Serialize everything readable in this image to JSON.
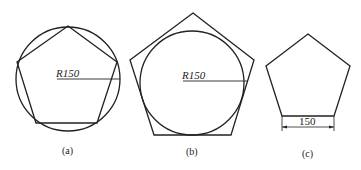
{
  "figures": [
    {
      "id": "a",
      "caption": "(a)",
      "description": "Regular pentagon inscribed in circle",
      "radius_label": "R150"
    },
    {
      "id": "b",
      "caption": "(b)",
      "description": "Regular pentagon circumscribed about circle",
      "radius_label": "R150"
    },
    {
      "id": "c",
      "caption": "(c)",
      "description": "Regular pentagon with given side length",
      "side_label": "150"
    }
  ],
  "colors": {
    "stroke": "#222222",
    "background": "#ffffff"
  }
}
